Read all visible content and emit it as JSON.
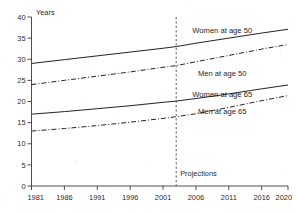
{
  "chart_data": {
    "type": "line",
    "title": "",
    "subtitle": "",
    "xlabel": "",
    "ylabel": "Years",
    "xlim": [
      1981,
      2020
    ],
    "ylim": [
      0,
      40
    ],
    "grid": false,
    "legend_position": "inline-right",
    "x_ticks": [
      "1981",
      "1986",
      "1991",
      "1996",
      "2001",
      "2006",
      "2011",
      "2016",
      "2020"
    ],
    "x_tick_values": [
      1981,
      1986,
      1991,
      1996,
      2001,
      2006,
      2011,
      2016,
      2020
    ],
    "y_ticks": [
      "0",
      "5",
      "10",
      "15",
      "20",
      "25",
      "30",
      "35",
      "40"
    ],
    "y_tick_values": [
      0,
      5,
      10,
      15,
      20,
      25,
      30,
      35,
      40
    ],
    "annotations": [
      {
        "name": "projections-divider",
        "label": "Projections",
        "x": 2003,
        "style": "vertical-dashed-line"
      }
    ],
    "series": [
      {
        "name": "Women at age 50",
        "style": "solid",
        "label_x": 2010,
        "label_y": 36.2,
        "x": [
          1981,
          1986,
          1991,
          1996,
          2001,
          2003,
          2006,
          2011,
          2016,
          2020
        ],
        "values": [
          29.0,
          29.9,
          30.8,
          31.7,
          32.6,
          33.0,
          33.8,
          35.0,
          36.2,
          37.1
        ]
      },
      {
        "name": "Men at age 50",
        "style": "dash-dot",
        "label_x": 2010,
        "label_y": 26.0,
        "x": [
          1981,
          1986,
          1991,
          1996,
          2001,
          2003,
          2006,
          2011,
          2016,
          2020
        ],
        "values": [
          24.0,
          25.0,
          26.0,
          27.0,
          28.1,
          28.5,
          29.4,
          30.9,
          32.4,
          33.5
        ]
      },
      {
        "name": "Women at age 65",
        "style": "solid",
        "label_x": 2010,
        "label_y": 21.0,
        "x": [
          1981,
          1986,
          1991,
          1996,
          2001,
          2003,
          2006,
          2011,
          2016,
          2020
        ],
        "values": [
          17.0,
          17.6,
          18.3,
          19.0,
          19.8,
          20.1,
          20.7,
          21.8,
          23.0,
          23.9
        ]
      },
      {
        "name": "Men at age 65",
        "style": "dash-dot",
        "label_x": 2010,
        "label_y": 17.1,
        "x": [
          1981,
          1986,
          1991,
          1996,
          2001,
          2003,
          2006,
          2011,
          2016,
          2020
        ],
        "values": [
          13.0,
          13.6,
          14.3,
          15.1,
          16.0,
          16.4,
          17.1,
          18.6,
          20.2,
          21.4
        ]
      }
    ]
  },
  "axis": {
    "y_title": "Years"
  },
  "labels": {
    "women_50": "Women at age 50",
    "men_50": "Men at age 50",
    "women_65": "Women at age 65",
    "men_65": "Men at age 65",
    "projections": "Projections"
  }
}
